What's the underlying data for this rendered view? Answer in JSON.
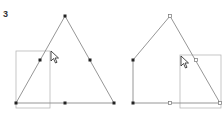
{
  "step": {
    "label": "3"
  },
  "colors": {
    "stroke": "#8a8a8a",
    "selection": "#b8b8b8",
    "node_filled": "#222222",
    "node_hollow_fill": "#ffffff",
    "node_hollow_stroke": "#777777",
    "background": "#ffffff"
  },
  "left_figure": {
    "shape": "triangle",
    "vertices": [
      [
        65,
        16
      ],
      [
        16,
        103
      ],
      [
        114,
        103
      ]
    ],
    "midpoints": [
      [
        40,
        60
      ],
      [
        90,
        60
      ],
      [
        65,
        103
      ]
    ],
    "selection_rect": {
      "x": 16,
      "y": 51,
      "w": 34,
      "h": 57
    },
    "cursor": {
      "x": 51,
      "y": 51,
      "icon": "arrow-cursor-icon"
    }
  },
  "right_figure": {
    "shape": "pentagon-house",
    "vertices": [
      [
        170,
        16
      ],
      [
        133,
        60
      ],
      [
        133,
        103
      ],
      [
        220,
        103
      ]
    ],
    "hollow_nodes": [
      [
        170,
        16
      ],
      [
        196,
        60
      ],
      [
        170,
        103
      ],
      [
        220,
        103
      ]
    ],
    "filled_nodes": [
      [
        133,
        60
      ],
      [
        133,
        103
      ]
    ],
    "selection_rect": {
      "x": 180,
      "y": 55,
      "w": 41,
      "h": 53
    },
    "cursor": {
      "x": 181,
      "y": 56,
      "icon": "arrow-cursor-icon"
    }
  }
}
